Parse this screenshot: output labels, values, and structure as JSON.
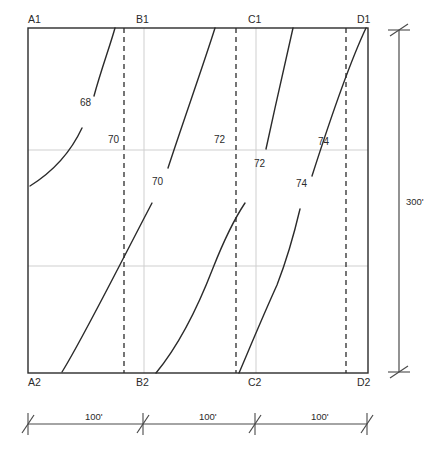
{
  "drawing": {
    "title": "Contour Grid Plan",
    "colors": {
      "border": "#2b2b2b",
      "gridline": "#cfcfcf",
      "dashed": "#2b2b2b",
      "contour": "#2b2b2b",
      "dimension": "#4a4a4a",
      "text": "#2b2b2b",
      "background": "#ffffff"
    },
    "plot": {
      "left": 28,
      "top": 28,
      "right": 368,
      "bottom": 373
    },
    "grid_labels_top": [
      {
        "text": "A1",
        "x": 28,
        "y": 14
      },
      {
        "text": "B1",
        "x": 136,
        "y": 14
      },
      {
        "text": "C1",
        "x": 248,
        "y": 14
      },
      {
        "text": "D1",
        "x": 357,
        "y": 14
      }
    ],
    "grid_labels_bottom": [
      {
        "text": "A2",
        "x": 28,
        "y": 377
      },
      {
        "text": "B2",
        "x": 136,
        "y": 377
      },
      {
        "text": "C2",
        "x": 248,
        "y": 377
      },
      {
        "text": "D2",
        "x": 357,
        "y": 377
      }
    ],
    "gridlines_vertical": [
      144,
      256
    ],
    "gridlines_horizontal": [
      150,
      266
    ],
    "dashed_lines_x": [
      124,
      236,
      346
    ],
    "contour_labels": [
      {
        "text": "68",
        "x": 80,
        "y": 98
      },
      {
        "text": "70",
        "x": 108,
        "y": 135
      },
      {
        "text": "70",
        "x": 152,
        "y": 177
      },
      {
        "text": "72",
        "x": 214,
        "y": 135
      },
      {
        "text": "72",
        "x": 254,
        "y": 159
      },
      {
        "text": "74",
        "x": 318,
        "y": 137
      },
      {
        "text": "74",
        "x": 296,
        "y": 179
      }
    ],
    "contours": [
      {
        "name": "contour-68-upper",
        "d": "M 115,28 C 110,46 101,70 94,96"
      },
      {
        "name": "contour-68-lower",
        "d": "M 30,186 C 46,176 68,158 82,128"
      },
      {
        "name": "contour-70-upper",
        "d": "M 215,28 C 203,66 183,122 168,168"
      },
      {
        "name": "contour-70-lower",
        "d": "M 62,372 C 82,340 118,268 152,203"
      },
      {
        "name": "contour-72-upper",
        "d": "M 293,28 C 286,58 275,108 266,149"
      },
      {
        "name": "contour-72-lower",
        "d": "M 156,373 C 175,350 196,312 213,268 C 228,230 239,212 245,203"
      },
      {
        "name": "contour-74-upper",
        "d": "M 366,28 C 350,62 328,126 312,176"
      },
      {
        "name": "contour-74-lower",
        "d": "M 239,373 C 248,352 262,318 277,285 C 289,254 296,226 300,209"
      }
    ],
    "dimension_vertical": {
      "label": "300'",
      "label_x": 406,
      "label_y": 197,
      "line_x": 399,
      "y_top": 30,
      "y_bottom": 372
    },
    "dimension_horizontal": {
      "line_y": 424,
      "ticks_x": [
        28,
        143,
        255,
        367
      ],
      "segments": [
        {
          "label": "100'",
          "x": 85,
          "y": 412
        },
        {
          "label": "100'",
          "x": 199,
          "y": 412
        },
        {
          "label": "100'",
          "x": 311,
          "y": 412
        }
      ]
    }
  }
}
